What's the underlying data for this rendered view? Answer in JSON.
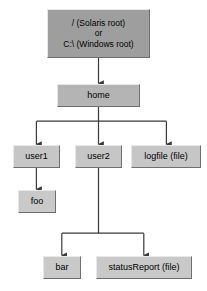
{
  "diagram": {
    "type": "tree",
    "background_color": "#ffffff",
    "line_color": "#3a3a3a",
    "colors": {
      "root_fill": "#9e9e9e",
      "level1_fill": "#b4b4b4",
      "level2_fill": "#c6c6c6",
      "level3_fill": "#c9c9c9",
      "border_light": "#e8e8e8",
      "border_dark": "#6f6f6f",
      "text": "#000000"
    },
    "nodes": [
      {
        "id": "root",
        "lines": [
          "/ (Solaris root)",
          "or",
          "C:\\ (Windows root)"
        ],
        "x": 47,
        "y": 9,
        "w": 103,
        "h": 49,
        "level": "root"
      },
      {
        "id": "home",
        "lines": [
          "home"
        ],
        "x": 57,
        "y": 84,
        "w": 83,
        "h": 23,
        "level": "level1"
      },
      {
        "id": "user1",
        "lines": [
          "user1"
        ],
        "x": 13,
        "y": 145,
        "w": 47,
        "h": 23,
        "level": "level2"
      },
      {
        "id": "user2",
        "lines": [
          "user2"
        ],
        "x": 75,
        "y": 145,
        "w": 47,
        "h": 23,
        "level": "level2"
      },
      {
        "id": "logfile",
        "lines": [
          "logfile (file)"
        ],
        "x": 131,
        "y": 145,
        "w": 70,
        "h": 23,
        "level": "level2"
      },
      {
        "id": "foo",
        "lines": [
          "foo"
        ],
        "x": 18,
        "y": 190,
        "w": 38,
        "h": 23,
        "level": "level3"
      },
      {
        "id": "bar",
        "lines": [
          "bar"
        ],
        "x": 43,
        "y": 256,
        "w": 38,
        "h": 23,
        "level": "level3"
      },
      {
        "id": "statusReport",
        "lines": [
          "statusReport (file)"
        ],
        "x": 96,
        "y": 256,
        "w": 96,
        "h": 23,
        "level": "level3"
      }
    ],
    "edges": [
      {
        "from": "root",
        "to": "home",
        "label": ""
      },
      {
        "from": "home",
        "to": "user1",
        "label": ""
      },
      {
        "from": "home",
        "to": "user2",
        "label": ""
      },
      {
        "from": "home",
        "to": "logfile",
        "label": ""
      },
      {
        "from": "user1",
        "to": "foo",
        "label": ""
      },
      {
        "from": "user2",
        "to": "bar",
        "label": ""
      },
      {
        "from": "user2",
        "to": "statusReport",
        "label": ""
      }
    ]
  }
}
